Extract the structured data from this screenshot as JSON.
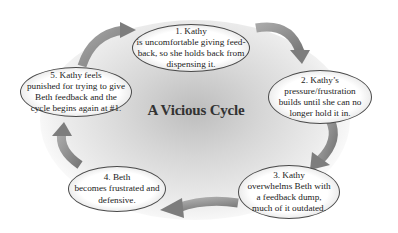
{
  "diagram": {
    "title": "A Vicious Cycle",
    "nodes": [
      {
        "id": 1,
        "text": "1. Kathy\nis uncomfortable giving feed-\nback, so she holds back from\ndispensing it."
      },
      {
        "id": 2,
        "text": "2. Kathy’s\npressure/frustration\nbuilds until she can no\nlonger hold it in."
      },
      {
        "id": 3,
        "text": "3. Kathy\noverwhelms Beth with\na feedback dump,\nmuch of it outdated."
      },
      {
        "id": 4,
        "text": "4. Beth\nbecomes frustrated and\ndefensive."
      },
      {
        "id": 5,
        "text": "5. Kathy feels\npunished for trying to give\nBeth feedback and the\ncycle begins again at #1."
      }
    ],
    "edges": [
      {
        "from": 1,
        "to": 2
      },
      {
        "from": 2,
        "to": 3
      },
      {
        "from": 3,
        "to": 4
      },
      {
        "from": 4,
        "to": 5
      },
      {
        "from": 5,
        "to": 1
      }
    ],
    "colors": {
      "arrow": "#8a8a8a",
      "node_border": "#4a4a4a",
      "background_glow": "#bdbdbd",
      "text": "#222222"
    }
  }
}
